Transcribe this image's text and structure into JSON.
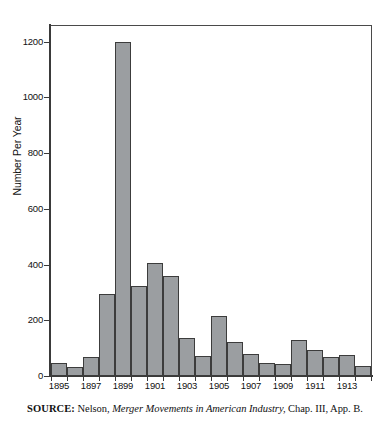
{
  "figure": {
    "source_note": {
      "keyword": "SOURCE:",
      "author": "Nelson,",
      "title": "Merger Movements in American Industry,",
      "locator": "Chap. III, App. B."
    },
    "colors": {
      "bar_fill": "#9b9ea1",
      "bar_stroke": "#3c3c3c",
      "axis": "#3a3a3a",
      "background": "#ffffff",
      "text": "#111111"
    }
  },
  "chart_data": {
    "type": "bar",
    "title": "",
    "subtitle": "",
    "xlabel": "",
    "ylabel": "Number Per Year",
    "ylim": [
      0,
      1256
    ],
    "yticks": [
      0,
      200,
      400,
      600,
      800,
      1000,
      1200
    ],
    "ytick_labels": [
      "0",
      "200",
      "400",
      "600",
      "800",
      "1000",
      "1200"
    ],
    "xlim": [
      1895,
      1915
    ],
    "xtick_labels": [
      "1895",
      "1897",
      "1899",
      "1901",
      "1903",
      "1905",
      "1907",
      "1909",
      "1911",
      "1913"
    ],
    "xticks": [
      1895,
      1897,
      1899,
      1901,
      1903,
      1905,
      1907,
      1909,
      1911,
      1913
    ],
    "grid": false,
    "legend": null,
    "categories": [
      "1895",
      "1896",
      "1897",
      "1898",
      "1899",
      "1900",
      "1901",
      "1902",
      "1903",
      "1904",
      "1905",
      "1906",
      "1907",
      "1908",
      "1909",
      "1910",
      "1911",
      "1912",
      "1913",
      "1914"
    ],
    "values": [
      47,
      32,
      68,
      294,
      1200,
      322,
      405,
      358,
      135,
      72,
      216,
      122,
      78,
      48,
      42,
      130,
      95,
      68,
      74,
      35
    ],
    "annotations": []
  }
}
